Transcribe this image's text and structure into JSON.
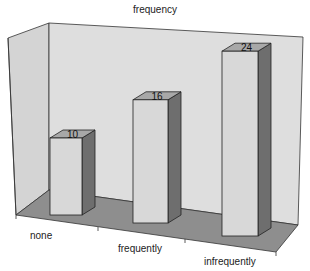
{
  "chart_data": {
    "type": "bar",
    "style": "3d",
    "title": "frequency",
    "xlabel": "",
    "ylabel": "",
    "categories": [
      "none",
      "frequently",
      "infrequently"
    ],
    "values": [
      10,
      16,
      24
    ],
    "data_labels": [
      "10",
      "16",
      "24"
    ],
    "legend": null,
    "grid": false,
    "colors": {
      "bar_front": "#d8d8d8",
      "bar_side": "#6e6e6e",
      "bar_top": "#a8a8a8",
      "back_wall": "#dcdcdc",
      "side_wall": "#d6d6d6",
      "floor": "#8c8c8c"
    }
  }
}
